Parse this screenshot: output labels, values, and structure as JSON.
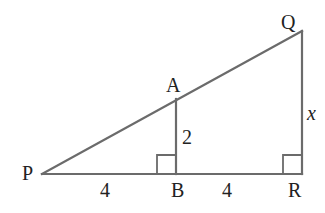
{
  "diagram": {
    "colors": {
      "line": "#6b6b6b",
      "text": "#222222",
      "background": "#ffffff"
    },
    "points": {
      "P": {
        "label": "P",
        "x": 42,
        "y": 174
      },
      "B": {
        "label": "B",
        "x": 176,
        "y": 174
      },
      "R": {
        "label": "R",
        "x": 302,
        "y": 174
      },
      "A": {
        "label": "A",
        "x": 176,
        "y": 99
      },
      "Q": {
        "label": "Q",
        "x": 302,
        "y": 31
      }
    },
    "segments": [
      {
        "from": "P",
        "to": "R"
      },
      {
        "from": "P",
        "to": "Q"
      },
      {
        "from": "A",
        "to": "B"
      },
      {
        "from": "Q",
        "to": "R"
      }
    ],
    "right_angles": [
      "B",
      "R"
    ],
    "measurements": {
      "PB": "4",
      "BR": "4",
      "AB": "2",
      "QR": "x"
    }
  }
}
